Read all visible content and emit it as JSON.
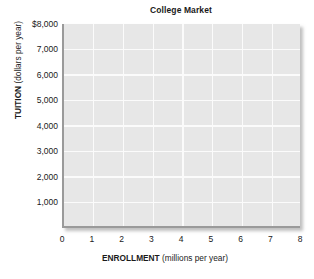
{
  "chart_data": {
    "type": "line",
    "title": "College Market",
    "xlabel_bold": "ENROLLMENT",
    "xlabel_unit": "(millions per year)",
    "ylabel_bold": "TUITION",
    "ylabel_unit": "(dollars per year)",
    "xlim": [
      0,
      8
    ],
    "ylim": [
      0,
      8000
    ],
    "xticks": [
      0,
      1,
      2,
      3,
      4,
      5,
      6,
      7,
      8
    ],
    "xtick_labels": [
      "0",
      "1",
      "2",
      "3",
      "4",
      "5",
      "6",
      "7",
      "8"
    ],
    "yticks": [
      1000,
      2000,
      3000,
      4000,
      5000,
      6000,
      7000,
      8000
    ],
    "ytick_labels": [
      "1,000",
      "2,000",
      "3,000",
      "4,000",
      "5,000",
      "6,000",
      "7,000",
      "$8,000"
    ],
    "grid": true,
    "legend": null,
    "series": [],
    "annotations": [],
    "plot_background_color": "#e7e7e7",
    "gridline_color": "#fbfbfb",
    "axis_color": "#9a9a9a",
    "text_color": "#1a1a1a"
  }
}
